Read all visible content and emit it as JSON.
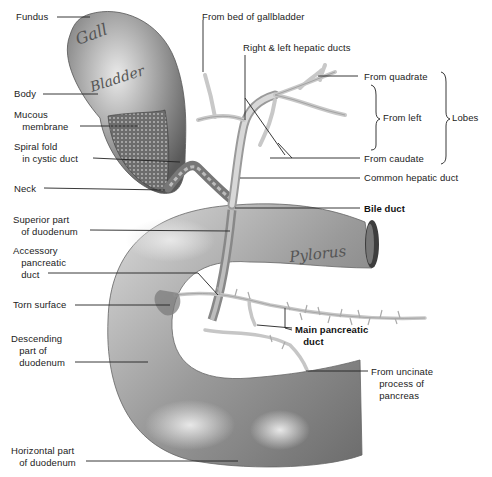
{
  "diagram": {
    "organ_labels": {
      "gallbladder_1": "Gall",
      "gallbladder_2": "Bladder",
      "pylorus": "Pylorus"
    },
    "labels": {
      "fundus": "Fundus",
      "body": "Body",
      "mucous_membrane": "Mucous\n   membrane",
      "spiral_fold": "Spiral fold\n   in cystic duct",
      "neck": "Neck",
      "superior_duodenum": "Superior part\n   of duodenum",
      "accessory_pancreatic_duct": "Accessory\n   pancreatic\n   duct",
      "torn_surface": "Torn surface",
      "descending_duodenum": "Descending\n   part of\n   duodenum",
      "horizontal_duodenum": "Horizontal part\n   of duodenum",
      "from_bed_of_gallbladder": "From bed of gallbladder",
      "right_left_hepatic_ducts": "Right & left hepatic ducts",
      "from_quadrate": "From quadrate",
      "from_left": "From left",
      "from_caudate": "From caudate",
      "lobes": "Lobes",
      "common_hepatic_duct": "Common hepatic duct",
      "bile_duct": "Bile duct",
      "main_pancreatic_duct": "Main pancreatic\n   duct",
      "from_uncinate": "From uncinate\n   process of\n   pancreas"
    },
    "bold_labels": [
      "Bile duct",
      "Main pancreatic duct"
    ]
  }
}
